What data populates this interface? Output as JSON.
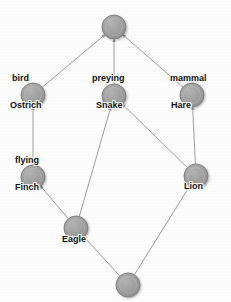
{
  "diagram": {
    "kind": "concept-lattice",
    "width": 231,
    "height": 302,
    "background_color": "#fdfdfd",
    "node_fill_color": "#9a9a9a",
    "node_stroke_color": "#7d7d7d",
    "edge_color": "#9e9e9e",
    "label_color": "#111111",
    "node_radius": 12,
    "nodes": [
      {
        "id": "top",
        "cx": 114,
        "cy": 27,
        "r": 12,
        "attribute_label": "",
        "object_label": "",
        "name": "node-top"
      },
      {
        "id": "ostrich",
        "cx": 33,
        "cy": 95,
        "r": 12,
        "attribute_label": "bird",
        "object_label": "Ostrich",
        "name": "node-ostrich"
      },
      {
        "id": "snake",
        "cx": 114,
        "cy": 96,
        "r": 12,
        "attribute_label": "preying",
        "object_label": "Snake",
        "name": "node-snake"
      },
      {
        "id": "hare",
        "cx": 192,
        "cy": 95,
        "r": 12,
        "attribute_label": "mammal",
        "object_label": "Hare",
        "name": "node-hare"
      },
      {
        "id": "finch",
        "cx": 33,
        "cy": 177,
        "r": 12,
        "attribute_label": "flying",
        "object_label": "Finch",
        "name": "node-finch"
      },
      {
        "id": "lion",
        "cx": 196,
        "cy": 176,
        "r": 12,
        "attribute_label": "",
        "object_label": "Lion",
        "name": "node-lion"
      },
      {
        "id": "eagle",
        "cx": 76,
        "cy": 228,
        "r": 12,
        "attribute_label": "",
        "object_label": "Eagle",
        "name": "node-eagle"
      },
      {
        "id": "bottom",
        "cx": 128,
        "cy": 285,
        "r": 12,
        "attribute_label": "",
        "object_label": "",
        "name": "node-bottom"
      }
    ],
    "edges": [
      {
        "from": "ostrich",
        "to": "top",
        "name": "edge-ostrich-top"
      },
      {
        "from": "snake",
        "to": "top",
        "name": "edge-snake-top"
      },
      {
        "from": "hare",
        "to": "top",
        "name": "edge-hare-top"
      },
      {
        "from": "finch",
        "to": "ostrich",
        "name": "edge-finch-ostrich"
      },
      {
        "from": "eagle",
        "to": "snake",
        "name": "edge-eagle-snake"
      },
      {
        "from": "lion",
        "to": "snake",
        "name": "edge-lion-snake"
      },
      {
        "from": "lion",
        "to": "hare",
        "name": "edge-lion-hare"
      },
      {
        "from": "eagle",
        "to": "finch",
        "name": "edge-eagle-finch"
      },
      {
        "from": "bottom",
        "to": "eagle",
        "name": "edge-bottom-eagle"
      },
      {
        "from": "bottom",
        "to": "lion",
        "name": "edge-bottom-lion"
      }
    ],
    "labels": [
      {
        "text": "bird",
        "x": 12,
        "y": 73,
        "anchor": "attribute",
        "node": "ostrich"
      },
      {
        "text": "Ostrich",
        "x": 10,
        "y": 100,
        "anchor": "object",
        "node": "ostrich"
      },
      {
        "text": "preying",
        "x": 92,
        "y": 73,
        "anchor": "attribute",
        "node": "snake"
      },
      {
        "text": "Snake",
        "x": 96,
        "y": 100,
        "anchor": "object",
        "node": "snake"
      },
      {
        "text": "mammal",
        "x": 170,
        "y": 73,
        "anchor": "attribute",
        "node": "hare"
      },
      {
        "text": "Hare",
        "x": 171,
        "y": 100,
        "anchor": "object",
        "node": "hare"
      },
      {
        "text": "flying",
        "x": 15,
        "y": 155,
        "anchor": "attribute",
        "node": "finch"
      },
      {
        "text": "Finch",
        "x": 15,
        "y": 182,
        "anchor": "object",
        "node": "finch"
      },
      {
        "text": "Lion",
        "x": 184,
        "y": 181,
        "anchor": "object",
        "node": "lion"
      },
      {
        "text": "Eagle",
        "x": 62,
        "y": 234,
        "anchor": "object",
        "node": "eagle"
      }
    ]
  }
}
